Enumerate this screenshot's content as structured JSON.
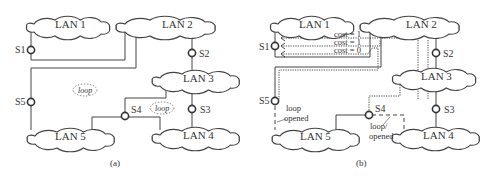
{
  "figures": [
    {
      "caption": "(a)",
      "lans": [
        "LAN 1",
        "LAN 2",
        "LAN 3",
        "LAN 4",
        "LAN 5"
      ],
      "switches": [
        "S1",
        "S2",
        "S3",
        "S4",
        "S5"
      ],
      "loop_labels": [
        "loop",
        "loop"
      ]
    },
    {
      "caption": "(b)",
      "lans": [
        "LAN 1",
        "LAN 2",
        "LAN 3",
        "LAN 4",
        "LAN 5"
      ],
      "switches": [
        "S1",
        "S2",
        "S3",
        "S4",
        "S5"
      ],
      "costs": [
        "cost = 1",
        "cost = 1",
        "cost = 0"
      ],
      "opened_labels": [
        {
          "line1": "loop",
          "line2": "opened"
        },
        {
          "line1": "loop/",
          "line2": "opened"
        }
      ]
    }
  ]
}
